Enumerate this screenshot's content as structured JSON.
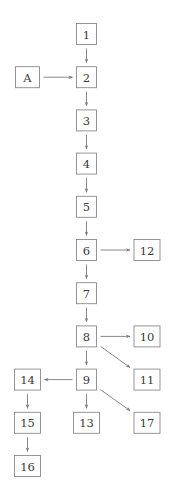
{
  "diagram": {
    "type": "flowchart",
    "nodes": [
      {
        "id": "1",
        "label": "1"
      },
      {
        "id": "A",
        "label": "A"
      },
      {
        "id": "2",
        "label": "2"
      },
      {
        "id": "3",
        "label": "3"
      },
      {
        "id": "4",
        "label": "4"
      },
      {
        "id": "5",
        "label": "5"
      },
      {
        "id": "6",
        "label": "6"
      },
      {
        "id": "12",
        "label": "12"
      },
      {
        "id": "7",
        "label": "7"
      },
      {
        "id": "8",
        "label": "8"
      },
      {
        "id": "10",
        "label": "10"
      },
      {
        "id": "11",
        "label": "11"
      },
      {
        "id": "9",
        "label": "9"
      },
      {
        "id": "14",
        "label": "14"
      },
      {
        "id": "13",
        "label": "13"
      },
      {
        "id": "17",
        "label": "17"
      },
      {
        "id": "15",
        "label": "15"
      },
      {
        "id": "16",
        "label": "16"
      }
    ],
    "edges": [
      {
        "from": "1",
        "to": "2"
      },
      {
        "from": "A",
        "to": "2"
      },
      {
        "from": "2",
        "to": "3"
      },
      {
        "from": "3",
        "to": "4"
      },
      {
        "from": "4",
        "to": "5"
      },
      {
        "from": "5",
        "to": "6"
      },
      {
        "from": "6",
        "to": "12"
      },
      {
        "from": "6",
        "to": "7"
      },
      {
        "from": "7",
        "to": "8"
      },
      {
        "from": "8",
        "to": "10"
      },
      {
        "from": "8",
        "to": "11"
      },
      {
        "from": "8",
        "to": "9"
      },
      {
        "from": "9",
        "to": "14"
      },
      {
        "from": "9",
        "to": "13"
      },
      {
        "from": "9",
        "to": "17"
      },
      {
        "from": "14",
        "to": "15"
      },
      {
        "from": "15",
        "to": "16"
      }
    ],
    "colors": {
      "node_border": "#8a8a8a",
      "edge": "#7a7a7a",
      "text": "#3a3a3a"
    }
  }
}
